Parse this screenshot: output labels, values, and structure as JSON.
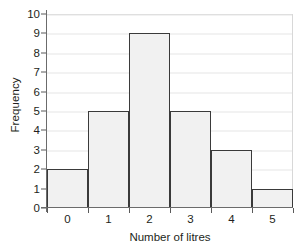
{
  "chart_data": {
    "type": "bar",
    "title": "",
    "subtitle": "",
    "xlabel": "Number of litres",
    "ylabel": "Frequency",
    "categories": [
      "0",
      "1",
      "2",
      "3",
      "4",
      "5"
    ],
    "values": [
      2,
      5,
      9,
      5,
      3,
      1
    ],
    "series": [
      {
        "name": "Frequency",
        "values": [
          2,
          5,
          9,
          5,
          3,
          1
        ]
      }
    ],
    "xlim": [
      -0.5,
      5.5
    ],
    "ylim": [
      0,
      10
    ],
    "ytick_labels": [
      "0",
      "1",
      "2",
      "3",
      "4",
      "5",
      "6",
      "7",
      "8",
      "9",
      "10"
    ],
    "ytick_values": [
      0,
      1,
      2,
      3,
      4,
      5,
      6,
      7,
      8,
      9,
      10
    ],
    "xtick_labels": [
      "0",
      "1",
      "2",
      "3",
      "4",
      "5"
    ],
    "bin_edges": [
      -0.5,
      0.5,
      1.5,
      2.5,
      3.5,
      4.5,
      5.5
    ],
    "grid": true,
    "grid_axis": "y",
    "legend": false,
    "legend_position": "none",
    "annotations": [],
    "colors": {
      "background": "#ffffff",
      "bar_fill": "#f1f1f1",
      "bar_edge": "#3a3a3a",
      "gridline": "#e6e6e6",
      "axis_line": "#6b6b6b",
      "tick_mark": "#5a5a5a",
      "text": "#231f20",
      "frame": "#d8d8d8"
    }
  }
}
